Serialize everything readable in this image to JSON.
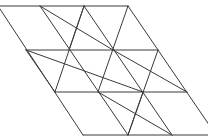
{
  "diagram": {
    "type": "subdivided-parallelogram",
    "stroke_color": "#3a3a3a",
    "background": "#ffffff",
    "grid": {
      "rows": 3,
      "cols": 3
    },
    "points": {
      "r0": [
        [
          -2,
          6
        ],
        [
          40,
          6
        ],
        [
          84,
          6
        ],
        [
          128,
          6
        ]
      ],
      "r1": [
        [
          26,
          50
        ],
        [
          69,
          50
        ],
        [
          113,
          50
        ],
        [
          158,
          50
        ]
      ],
      "r2": [
        [
          55,
          92
        ],
        [
          98,
          92
        ],
        [
          143,
          92
        ],
        [
          187,
          92
        ]
      ],
      "r3": [
        [
          83,
          135
        ],
        [
          128,
          135
        ],
        [
          172,
          135
        ],
        [
          216,
          135
        ]
      ]
    },
    "lines": [
      [
        -2,
        6,
        128,
        6
      ],
      [
        26,
        50,
        158,
        50
      ],
      [
        55,
        92,
        187,
        92
      ],
      [
        83,
        135,
        216,
        135
      ],
      [
        -2,
        6,
        83,
        135
      ],
      [
        40,
        6,
        128,
        135
      ],
      [
        84,
        6,
        172,
        135
      ],
      [
        128,
        6,
        216,
        135
      ],
      [
        84,
        6,
        55,
        92
      ],
      [
        55,
        92,
        26,
        50
      ],
      [
        40,
        6,
        113,
        50
      ],
      [
        26,
        50,
        143,
        92
      ],
      [
        113,
        50,
        187,
        92
      ],
      [
        98,
        92,
        172,
        135
      ],
      [
        84,
        6,
        69,
        50
      ],
      [
        128,
        6,
        98,
        92
      ],
      [
        158,
        50,
        128,
        135
      ],
      [
        143,
        92,
        128,
        135
      ]
    ]
  }
}
